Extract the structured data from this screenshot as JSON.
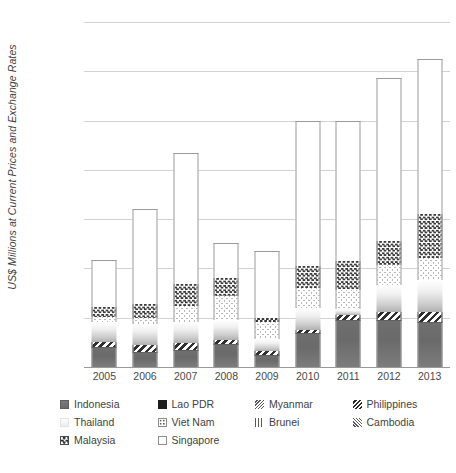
{
  "chart_data": {
    "type": "bar",
    "stacked": true,
    "title": "",
    "xlabel": "",
    "ylabel": "US$ Millions at Current Prices and Exchange Rates",
    "categories": [
      "2005",
      "2006",
      "2007",
      "2008",
      "2009",
      "2010",
      "2011",
      "2012",
      "2013"
    ],
    "ylim": [
      0,
      140000
    ],
    "ytick_values": [
      0,
      20000,
      40000,
      60000,
      80000,
      100000,
      120000,
      140000
    ],
    "ytick_labels": [
      "0",
      "20,000",
      "40,000",
      "60,000",
      "80,000",
      "1,00,000",
      "1,20,000",
      "1,40,000"
    ],
    "grid": true,
    "legend_position": "bottom",
    "series": [
      {
        "name": "Indonesia",
        "pattern": "solid-gray",
        "values": [
          8300,
          6200,
          6900,
          9300,
          4900,
          13800,
          19200,
          19200,
          18400
        ]
      },
      {
        "name": "Philippines",
        "pattern": "diagonal-stripe",
        "values": [
          1900,
          2900,
          2900,
          1500,
          1600,
          1200,
          2000,
          3300,
          3900
        ]
      },
      {
        "name": "Thailand",
        "pattern": "light-gradient",
        "values": [
          8000,
          8200,
          8400,
          8400,
          4800,
          9100,
          2400,
          10700,
          13000
        ]
      },
      {
        "name": "Viet Nam",
        "pattern": "dotted",
        "values": [
          2000,
          2400,
          6700,
          9600,
          7000,
          8000,
          7500,
          8400,
          8900
        ]
      },
      {
        "name": "Malaysia",
        "pattern": "checkerboard",
        "values": [
          4000,
          5900,
          8800,
          7300,
          1500,
          9100,
          12000,
          9400,
          17800
        ]
      },
      {
        "name": "Singapore",
        "pattern": "white-outline",
        "values": [
          19300,
          38400,
          53300,
          14400,
          27200,
          58800,
          56900,
          66400,
          63100
        ]
      },
      {
        "name": "Lao PDR",
        "pattern": "solid-black",
        "values": [
          0,
          0,
          0,
          0,
          0,
          0,
          0,
          0,
          0
        ]
      },
      {
        "name": "Myanmar",
        "pattern": "fine-diagonal",
        "values": [
          0,
          0,
          0,
          0,
          0,
          0,
          0,
          0,
          0
        ]
      },
      {
        "name": "Brunei",
        "pattern": "vertical-stripe",
        "values": [
          0,
          0,
          0,
          0,
          0,
          0,
          0,
          0,
          0
        ]
      },
      {
        "name": "Cambodia",
        "pattern": "fine-diagonal-alt",
        "values": [
          0,
          0,
          0,
          0,
          0,
          0,
          0,
          0,
          0
        ]
      }
    ],
    "totals": [
      43500,
      64000,
      87000,
      50500,
      47000,
      100000,
      100000,
      117400,
      125100
    ]
  },
  "axis": {
    "y_title": "US$ Millions at Current Prices and Exchange Rates"
  },
  "legend": {
    "items": [
      {
        "label": "Indonesia",
        "swatch": "sw-indonesia"
      },
      {
        "label": "Lao PDR",
        "swatch": "sw-laopdr"
      },
      {
        "label": "Myanmar",
        "swatch": "sw-myanmar"
      },
      {
        "label": "Philippines",
        "swatch": "sw-philippines"
      },
      {
        "label": "Thailand",
        "swatch": "sw-thailand"
      },
      {
        "label": "Viet Nam",
        "swatch": "sw-vietnam"
      },
      {
        "label": "Brunei",
        "swatch": "sw-brunei"
      },
      {
        "label": "Cambodia",
        "swatch": "sw-cambodia"
      },
      {
        "label": "Malaysia",
        "swatch": "sw-malaysia"
      },
      {
        "label": "Singapore",
        "swatch": "sw-singapore"
      }
    ]
  },
  "colors": {
    "grid": "#d2d2d2",
    "axis": "#9a9a9a",
    "text": "#3f3f3f",
    "indonesia": "#6f6f6f",
    "singapore": "#ffffff"
  }
}
